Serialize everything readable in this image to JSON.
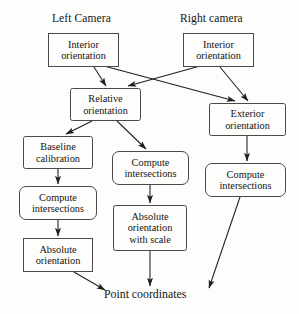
{
  "diagram": {
    "title_left": "Left Camera",
    "title_right": "Right camera",
    "terminal": "Point coordinates",
    "colors": {
      "background": "#fdfdfc",
      "stroke": "#4a4a4a",
      "arrow": "#1f1f1f",
      "text": "#141414"
    },
    "nodes": [
      {
        "id": "left-interior-orientation",
        "label": "Interior\norientation",
        "x": 48,
        "y": 33,
        "w": 71,
        "h": 34,
        "shape": "square"
      },
      {
        "id": "right-interior-orientation",
        "label": "Interior\norientation",
        "x": 183,
        "y": 33,
        "w": 71,
        "h": 34,
        "shape": "square"
      },
      {
        "id": "relative-orientation",
        "label": "Relative\norientation",
        "x": 70,
        "y": 88,
        "w": 71,
        "h": 33,
        "shape": "soft"
      },
      {
        "id": "exterior-orientation",
        "label": "Exterior\norientation",
        "x": 209,
        "y": 103,
        "w": 77,
        "h": 33,
        "shape": "soft"
      },
      {
        "id": "baseline-calibration",
        "label": "Baseline\ncalibration",
        "x": 23,
        "y": 136,
        "w": 70,
        "h": 33,
        "shape": "soft"
      },
      {
        "id": "middle-compute-intersections",
        "label": "Compute\nintersections",
        "x": 112,
        "y": 151,
        "w": 77,
        "h": 34,
        "shape": "rounded"
      },
      {
        "id": "right-compute-intersections",
        "label": "Compute\nintersections",
        "x": 205,
        "y": 163,
        "w": 81,
        "h": 34,
        "shape": "rounded"
      },
      {
        "id": "left-compute-intersections",
        "label": "Compute\nintersections",
        "x": 19,
        "y": 186,
        "w": 78,
        "h": 34,
        "shape": "rounded"
      },
      {
        "id": "absolute-orientation-scale",
        "label": "Absolute\norientation\nwith scale",
        "x": 113,
        "y": 205,
        "w": 74,
        "h": 46,
        "shape": "soft"
      },
      {
        "id": "absolute-orientation",
        "label": "Absolute\norientation",
        "x": 23,
        "y": 238,
        "w": 70,
        "h": 34,
        "shape": "square"
      }
    ],
    "edges": [
      {
        "id": "edge-left-interior-to-relative",
        "from": "left-interior-orientation",
        "to": "relative-orientation",
        "points": "94,67 106,86"
      },
      {
        "id": "edge-left-interior-to-exterior",
        "from": "left-interior-orientation",
        "to": "exterior-orientation",
        "points": "104,66 235,101"
      },
      {
        "id": "edge-right-interior-to-relative",
        "from": "right-interior-orientation",
        "to": "relative-orientation",
        "points": "200,66 128,86"
      },
      {
        "id": "edge-right-interior-to-exterior",
        "from": "right-interior-orientation",
        "to": "exterior-orientation",
        "points": "220,67 248,101"
      },
      {
        "id": "edge-relative-to-baseline",
        "from": "relative-orientation",
        "to": "baseline-calibration",
        "points": "92,121 66,134"
      },
      {
        "id": "edge-relative-to-middle-compute",
        "from": "relative-orientation",
        "to": "middle-compute-intersections",
        "points": "117,121 146,149"
      },
      {
        "id": "edge-exterior-to-right-compute",
        "from": "exterior-orientation",
        "to": "right-compute-intersections",
        "points": "247,136 247,161"
      },
      {
        "id": "edge-baseline-to-left-compute",
        "from": "baseline-calibration",
        "to": "left-compute-intersections",
        "points": "58,169 58,184"
      },
      {
        "id": "edge-left-compute-to-absolute",
        "from": "left-compute-intersections",
        "to": "absolute-orientation",
        "points": "58,220 58,236"
      },
      {
        "id": "edge-middle-compute-to-absolute-scale",
        "from": "middle-compute-intersections",
        "to": "absolute-orientation-scale",
        "points": "150,185 150,203"
      },
      {
        "id": "edge-absolute-to-point",
        "from": "absolute-orientation",
        "to": "terminal",
        "points": "74,272 105,290"
      },
      {
        "id": "edge-absolute-scale-to-point",
        "from": "absolute-orientation-scale",
        "to": "terminal",
        "points": "150,251 150,286"
      },
      {
        "id": "edge-right-compute-to-point",
        "from": "right-compute-intersections",
        "to": "terminal",
        "points": "240,197 209,288"
      }
    ]
  }
}
